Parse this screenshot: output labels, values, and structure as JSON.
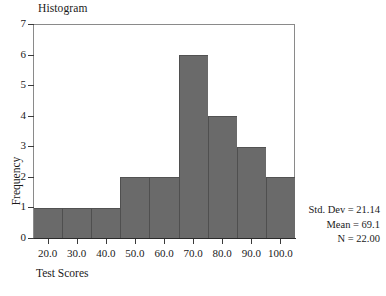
{
  "chart_data": {
    "type": "bar",
    "title": "Histogram",
    "xlabel": "Test Scores",
    "ylabel": "Frequency",
    "categories": [
      "20.0",
      "30.0",
      "40.0",
      "50.0",
      "60.0",
      "70.0",
      "80.0",
      "90.0",
      "100.0"
    ],
    "values": [
      1,
      1,
      1,
      2,
      2,
      6,
      4,
      3,
      2
    ],
    "ylim": [
      0,
      7
    ],
    "yticks": [
      "0",
      "1",
      "2",
      "3",
      "4",
      "5",
      "6",
      "7"
    ],
    "ytick_values": [
      0,
      1,
      2,
      3,
      4,
      5,
      6,
      7
    ],
    "xlim": [
      15.0,
      105.0
    ],
    "bin_width": 10,
    "grid": false,
    "legend": null,
    "bar_color": "#6a6a6a",
    "bar_edge_color": "#4f4f4f",
    "background_color": "#ffffff",
    "axis_color": "#2b2b2b",
    "annotations": [
      "Std. Dev = 21.14",
      "Mean = 69.1",
      "N = 22.00"
    ]
  },
  "statistics": {
    "std_dev_label": "Std. Dev = 21.14",
    "mean_label": "Mean = 69.1",
    "n_label": "N = 22.00"
  }
}
